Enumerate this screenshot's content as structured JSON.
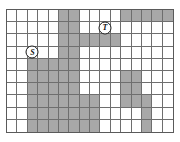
{
  "diagram": {
    "type": "occupancy-grid",
    "columns": 16,
    "rows": 10,
    "colors": {
      "free_cell": "#ffffff",
      "blocked_cell": "#a8a8a8",
      "grid_line": "#6e6e6e",
      "border": "#5a5a5a",
      "marker_text": "#111111"
    },
    "markers": [
      {
        "name": "start",
        "label": "S",
        "row": 4,
        "col": 3
      },
      {
        "name": "target",
        "label": "T",
        "row": 2,
        "col": 10
      }
    ],
    "blocked_cells": [
      [
        1,
        6
      ],
      [
        1,
        7
      ],
      [
        1,
        12
      ],
      [
        1,
        13
      ],
      [
        1,
        14
      ],
      [
        1,
        15
      ],
      [
        1,
        16
      ],
      [
        2,
        6
      ],
      [
        2,
        7
      ],
      [
        3,
        6
      ],
      [
        3,
        7
      ],
      [
        3,
        8
      ],
      [
        3,
        9
      ],
      [
        3,
        10
      ],
      [
        3,
        11
      ],
      [
        4,
        6
      ],
      [
        4,
        7
      ],
      [
        5,
        3
      ],
      [
        5,
        4
      ],
      [
        5,
        5
      ],
      [
        5,
        6
      ],
      [
        5,
        7
      ],
      [
        6,
        3
      ],
      [
        6,
        4
      ],
      [
        6,
        5
      ],
      [
        6,
        6
      ],
      [
        6,
        7
      ],
      [
        6,
        12
      ],
      [
        6,
        13
      ],
      [
        7,
        3
      ],
      [
        7,
        4
      ],
      [
        7,
        5
      ],
      [
        7,
        6
      ],
      [
        7,
        7
      ],
      [
        7,
        12
      ],
      [
        7,
        13
      ],
      [
        8,
        3
      ],
      [
        8,
        4
      ],
      [
        8,
        5
      ],
      [
        8,
        6
      ],
      [
        8,
        7
      ],
      [
        8,
        8
      ],
      [
        8,
        9
      ],
      [
        8,
        12
      ],
      [
        8,
        13
      ],
      [
        8,
        14
      ],
      [
        9,
        3
      ],
      [
        9,
        4
      ],
      [
        9,
        5
      ],
      [
        9,
        6
      ],
      [
        9,
        7
      ],
      [
        9,
        8
      ],
      [
        9,
        9
      ],
      [
        9,
        14
      ],
      [
        10,
        3
      ],
      [
        10,
        4
      ],
      [
        10,
        5
      ],
      [
        10,
        6
      ],
      [
        10,
        7
      ],
      [
        10,
        8
      ],
      [
        10,
        9
      ],
      [
        10,
        14
      ]
    ]
  }
}
